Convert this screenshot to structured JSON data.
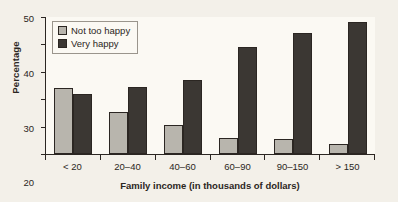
{
  "chart_data": {
    "type": "bar",
    "title": "",
    "xlabel": "Family income (in thousands of dollars)",
    "ylabel": "Percentage",
    "categories": [
      "< 20",
      "20–40",
      "40–60",
      "60–90",
      "90–150",
      "> 150"
    ],
    "series": [
      {
        "name": "Not too happy",
        "color": "#b8b5ad",
        "values": [
          24,
          15.5,
          10.5,
          6,
          5.5,
          3.5
        ]
      },
      {
        "name": "Very happy",
        "color": "#3b3733",
        "values": [
          22,
          24.5,
          27,
          39,
          44,
          48
        ]
      }
    ],
    "ylim": [
      0,
      50
    ],
    "yticks": [
      0,
      10,
      20,
      30,
      40,
      50
    ],
    "ytick_labels": [
      "0",
      "10",
      "20",
      "30",
      "40",
      "50"
    ],
    "grid": "horizontal-dotted",
    "legend_position": "top-left-inside"
  },
  "legend": {
    "items": [
      {
        "label": "Not too happy",
        "swatch": "light-gray-square"
      },
      {
        "label": "Very happy",
        "swatch": "dark-gray-square"
      }
    ]
  },
  "colors": {
    "background": "#f3f0e9",
    "plot_background": "#fbf9f3",
    "axis": "#2b2622",
    "grid": "#908c84",
    "series_light": "#b8b5ad",
    "series_dark": "#3b3733"
  }
}
